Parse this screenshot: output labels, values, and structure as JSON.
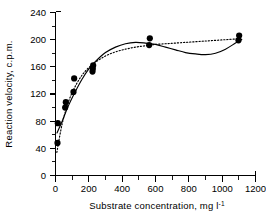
{
  "chart_data": {
    "type": "scatter",
    "title": "",
    "xlabel": "Substrate concentration, mg l",
    "xlabel_superscript": "-1",
    "ylabel": "Reaction velocity, c.p.m.",
    "xlim": [
      0,
      1200
    ],
    "ylim": [
      0,
      240
    ],
    "xticks": [
      0,
      200,
      400,
      600,
      800,
      1000,
      1200
    ],
    "yticks": [
      0,
      40,
      80,
      120,
      160,
      200,
      240
    ],
    "xtick_labels": [
      "0",
      "200",
      "400",
      "600",
      "800",
      "1000",
      "1200"
    ],
    "ytick_labels": [
      "0",
      "40",
      "80",
      "120",
      "160",
      "200",
      "240"
    ],
    "x_minor_interval": 100,
    "y_minor_interval": 20,
    "grid": false,
    "legend": null,
    "legend_position": "none",
    "points": [
      {
        "x": 12,
        "y": 48
      },
      {
        "x": 14,
        "y": 77
      },
      {
        "x": 58,
        "y": 100
      },
      {
        "x": 62,
        "y": 108
      },
      {
        "x": 108,
        "y": 123
      },
      {
        "x": 112,
        "y": 143
      },
      {
        "x": 222,
        "y": 153
      },
      {
        "x": 224,
        "y": 157
      },
      {
        "x": 226,
        "y": 162
      },
      {
        "x": 562,
        "y": 192
      },
      {
        "x": 566,
        "y": 202
      },
      {
        "x": 1098,
        "y": 199
      },
      {
        "x": 1102,
        "y": 206
      }
    ],
    "series": [
      {
        "name": "solid-fit-curve",
        "style": "solid",
        "x": [
          8,
          40,
          80,
          120,
          160,
          200,
          240,
          300,
          360,
          420,
          480,
          540,
          600,
          660,
          720,
          780,
          840,
          900,
          960,
          1020,
          1080,
          1120
        ],
        "y": [
          62,
          80,
          104,
          124,
          142,
          157,
          168,
          181,
          189,
          194,
          196,
          195,
          193,
          189,
          185,
          181,
          179,
          178,
          180,
          186,
          195,
          201
        ]
      },
      {
        "name": "dotted-fit-curve",
        "style": "dotted",
        "x": [
          8,
          40,
          80,
          120,
          160,
          200,
          240,
          300,
          360,
          420,
          480,
          540,
          600,
          660,
          720,
          780,
          840,
          900,
          960,
          1020,
          1080,
          1120
        ],
        "y": [
          34,
          76,
          110,
          132,
          148,
          159,
          167,
          176,
          182,
          186,
          189,
          191,
          193,
          194,
          195,
          196,
          197,
          198,
          199,
          200,
          201,
          202
        ]
      }
    ]
  },
  "figure": {
    "background_color": "#ffffff",
    "ink_color": "#000000",
    "marker_color": "#000000",
    "marker_shape": "filled-circle"
  }
}
